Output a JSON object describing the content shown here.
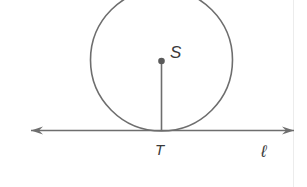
{
  "figure": {
    "labels": {
      "center": "S",
      "tangent_point": "T",
      "line": "ℓ"
    },
    "colors": {
      "stroke": "#6e6e6e",
      "point": "#5a5a5a",
      "text": "#3a3a3a"
    }
  }
}
